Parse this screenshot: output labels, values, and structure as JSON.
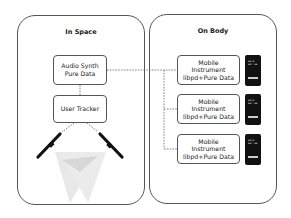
{
  "in_space": {
    "title": "In Space",
    "audio_synth": {
      "line1": "Audio Synth",
      "line2": "Pure Data"
    },
    "user_tracker": {
      "label": "User Tracker"
    },
    "sensors": [
      {
        "name": "left-depth-camera"
      },
      {
        "name": "right-depth-camera"
      }
    ]
  },
  "on_body": {
    "title": "On Body",
    "instruments": [
      {
        "line1": "Mobile",
        "line2": "Instrument",
        "line3": "libpd+Pure Data"
      },
      {
        "line1": "Mobile",
        "line2": "Instrument",
        "line3": "libpd+Pure Data"
      },
      {
        "line1": "Mobile",
        "line2": "Instrument",
        "line3": "libpd+Pure Data"
      }
    ],
    "phone_screen_text": "▪▪▫▪ ▪▪▫ ▪▪"
  },
  "colors": {
    "border": "#555555",
    "phone": "#111111",
    "dash": "#666666",
    "field": "#bdbdbd"
  }
}
